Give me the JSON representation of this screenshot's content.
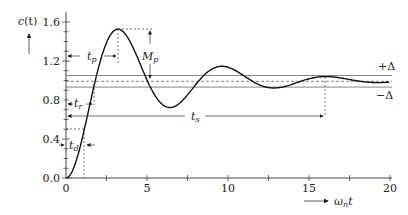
{
  "chart_data": {
    "type": "line",
    "title": "",
    "xlabel": "ω_n t",
    "ylabel": "c(t)",
    "xlim": [
      0,
      20
    ],
    "ylim": [
      0,
      1.7
    ],
    "xticks": [
      "0",
      "5",
      "10",
      "15",
      "20"
    ],
    "yticks": [
      "0.0",
      "0.4",
      "0.8",
      "1.2",
      "1.6"
    ],
    "series": [
      {
        "name": "step response",
        "zeta": 0.2,
        "description": "underdamped second-order step response"
      }
    ],
    "tolerance_band": {
      "upper_label": "+Δ",
      "lower_label": "−Δ",
      "upper": 1.03,
      "lower": 0.97,
      "final_value": 1.0
    },
    "annotations": [
      {
        "label": "t_p",
        "meaning": "peak time",
        "x": 3.2
      },
      {
        "label": "M_p",
        "meaning": "maximum overshoot",
        "value": 0.52
      },
      {
        "label": "t_r",
        "meaning": "rise time"
      },
      {
        "label": "t_d",
        "meaning": "delay time"
      },
      {
        "label": "t_s",
        "meaning": "settling time",
        "x": 16
      }
    ]
  },
  "labels": {
    "ylabel_main": "c",
    "ylabel_arg": "(t)",
    "xlabel_omega": "ω",
    "xlabel_sub": "n",
    "xlabel_t": "t",
    "plus_delta": "+Δ",
    "minus_delta": "−Δ",
    "tp_main": "t",
    "tp_sub": "p",
    "mp_main": "M",
    "mp_sub": "p",
    "tr_main": "t",
    "tr_sub": "r",
    "td_main": "t",
    "td_sub": "d",
    "ts_main": "t",
    "ts_sub": "s",
    "y0": "0.0",
    "y1": "0.4",
    "y2": "0.8",
    "y3": "1.2",
    "y4": "1.6",
    "x0": "0",
    "x1": "5",
    "x2": "10",
    "x3": "15",
    "x4": "20"
  }
}
